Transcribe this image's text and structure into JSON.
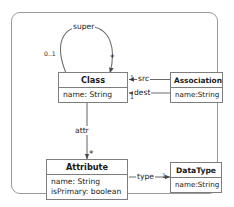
{
  "diagram": {
    "type": "uml-class-diagram",
    "title": "",
    "frame": {
      "border_color": "#9a9a9a"
    },
    "classes": [
      {
        "id": "class",
        "name": "Class",
        "attributes": [
          "name:  String"
        ]
      },
      {
        "id": "association",
        "name": "Association",
        "attributes": [
          "name:String"
        ]
      },
      {
        "id": "attribute",
        "name": "Attribute",
        "attributes": [
          "name:  String",
          "isPrimary:  boolean"
        ]
      },
      {
        "id": "datatype",
        "name": "DataType",
        "attributes": [
          "name:String"
        ]
      }
    ],
    "edges": [
      {
        "id": "super",
        "label": "super",
        "from": "class",
        "to": "class",
        "source_multiplicity": "0..1",
        "target_multiplicity": "*",
        "style": "self-loop"
      },
      {
        "id": "src",
        "label": "src",
        "from": "association",
        "to": "class",
        "target_multiplicity": "1",
        "style": "straight"
      },
      {
        "id": "dest",
        "label": "dest",
        "from": "association",
        "to": "class",
        "target_multiplicity": "1",
        "style": "straight"
      },
      {
        "id": "attr",
        "label": "attr",
        "from": "class",
        "to": "attribute",
        "target_multiplicity": "*",
        "style": "straight"
      },
      {
        "id": "type",
        "label": "type",
        "from": "attribute",
        "to": "datatype",
        "target_multiplicity": "1",
        "style": "straight"
      }
    ]
  }
}
